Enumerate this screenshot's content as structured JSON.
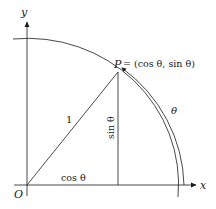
{
  "diagram": {
    "axes": {
      "x_label": "x",
      "y_label": "y",
      "origin_label": "O"
    },
    "labels": {
      "point_name": "P",
      "point_def": "= (cos θ,  sin θ)",
      "radius": "1",
      "cos": "cos θ",
      "sin": "sin θ",
      "angle": "θ"
    },
    "colors": {
      "stroke": "#1a1a1a",
      "background": "#ffffff"
    }
  }
}
